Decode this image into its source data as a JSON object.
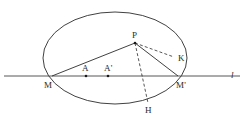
{
  "figure": {
    "type": "geometric-diagram",
    "canvas": {
      "width": 250,
      "height": 120
    },
    "colors": {
      "background": "#ffffff",
      "stroke": "#2b2b2b",
      "label": "#2b2b2b",
      "point_fill": "#1a1a1a"
    },
    "ellipse": {
      "name": "main-ellipse",
      "cx": 115,
      "cy": 58,
      "rx": 72,
      "ry": 46,
      "stroke_width": 0.9,
      "style": "solid"
    },
    "line_l": {
      "name": "line-l",
      "x1": 4,
      "y1": 76,
      "x2": 240,
      "y2": 76,
      "stroke_width": 0.8,
      "style": "solid"
    },
    "points": [
      {
        "id": "M",
        "label": "M",
        "x": 52,
        "y": 76,
        "label_x": 44,
        "label_y": 81,
        "dot": false
      },
      {
        "id": "A",
        "label": "A",
        "x": 86,
        "y": 76,
        "label_x": 82,
        "label_y": 64,
        "dot": true
      },
      {
        "id": "Ap",
        "label": "A'",
        "x": 108,
        "y": 76,
        "label_x": 104,
        "label_y": 64,
        "dot": true
      },
      {
        "id": "P",
        "label": "P",
        "x": 135,
        "y": 43,
        "label_x": 132,
        "label_y": 31,
        "dot": true
      },
      {
        "id": "K",
        "label": "K",
        "x": 174,
        "y": 57,
        "label_x": 178,
        "label_y": 54,
        "dot": false
      },
      {
        "id": "Mp",
        "label": "M'",
        "x": 178,
        "y": 76,
        "label_x": 176,
        "label_y": 81,
        "dot": false
      },
      {
        "id": "H",
        "label": "H",
        "x": 148,
        "y": 103,
        "label_x": 145,
        "label_y": 106,
        "dot": false
      }
    ],
    "line_label": {
      "id": "l",
      "label": "l",
      "label_x": 231,
      "label_y": 71
    },
    "segments": [
      {
        "name": "segment-M-P",
        "from": "M",
        "to": "P",
        "style": "solid",
        "stroke_width": 0.9
      },
      {
        "name": "segment-P-Mp",
        "from": "P",
        "to": "Mp",
        "style": "solid",
        "stroke_width": 0.9
      },
      {
        "name": "segment-P-K",
        "from": "P",
        "to": "K",
        "style": "dashed",
        "stroke_width": 0.8
      },
      {
        "name": "segment-P-H",
        "from": "P",
        "to": "H",
        "style": "dashed",
        "stroke_width": 0.8
      }
    ]
  }
}
